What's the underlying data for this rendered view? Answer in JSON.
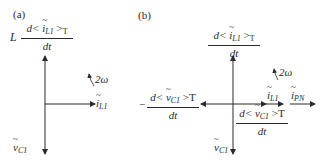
{
  "panels": [
    {
      "id": "a",
      "label": "(a)",
      "vertical_axis_top_label": {
        "prefix": "L",
        "numerator": "d< ĩ_L1 >_T",
        "denominator": "dt"
      },
      "vertical_axis_bottom_label": "ṽ_C1",
      "horizontal_axis_right_label": "ĩ_L1",
      "rotation_label": "2ω"
    },
    {
      "id": "b",
      "label": "(b)",
      "vertical_axis_top_label": {
        "numerator": "d< ĩ_L1 >_T",
        "denominator": "dt"
      },
      "vertical_axis_bottom_label": "ṽ_C1",
      "horizontal_axis_left_label": {
        "prefix": "−",
        "numerator": "d< ṽ_C1 >T",
        "denominator": "dt"
      },
      "horizontal_axis_lower_label": {
        "numerator": "d< ṽ_C1 >T",
        "denominator": "dt"
      },
      "horizontal_vectors": [
        "ĩ_L1",
        "ĩ_PN"
      ],
      "rotation_label": "2ω"
    }
  ],
  "text": {
    "a_label": "(a)",
    "b_label": "(b)",
    "L": "L",
    "d_lt": "d<",
    "i": "i",
    "v": "v",
    "L1": "L1",
    "C1": "C1",
    "PN": "PN",
    "gtT": ">",
    "T": "T",
    "gtT_plain": ">T",
    "dt": "dt",
    "minus": "−",
    "two_omega": "2ω"
  },
  "colors": {
    "ink": "#2a2a2a",
    "background": "#ffffff"
  }
}
